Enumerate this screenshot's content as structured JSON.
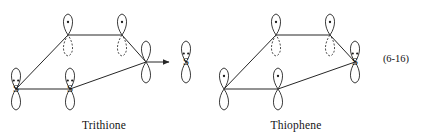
{
  "figure": {
    "equation_number": "(6-16)",
    "background_color": "#ffffff",
    "ink_color": "#262626",
    "structures": [
      {
        "id": "trithione",
        "caption": "Trithione",
        "caption_x": 104,
        "caption_y": 129,
        "atoms": [
          {
            "id": "c-top-left",
            "label": "",
            "x": 68,
            "y": 35,
            "orbital": "p-vertical-split",
            "electrons": 1,
            "lone_pair": false
          },
          {
            "id": "c-top-right",
            "label": "",
            "x": 122,
            "y": 35,
            "orbital": "p-vertical-split",
            "electrons": 1,
            "lone_pair": false
          },
          {
            "id": "c-right",
            "label": "",
            "x": 146,
            "y": 62,
            "orbital": "p-vertical-solid",
            "electrons": 0,
            "lone_pair": false
          },
          {
            "id": "s-bottom-left",
            "label": "S",
            "x": 16,
            "y": 89,
            "orbital": "p-vertical-solid",
            "electrons": 0,
            "lone_pair": true
          },
          {
            "id": "s-bottom-mid",
            "label": "S",
            "x": 70,
            "y": 89,
            "orbital": "p-vertical-solid",
            "electrons": 0,
            "lone_pair": true
          },
          {
            "id": "s-exocyclic",
            "label": "S",
            "x": 186,
            "y": 62,
            "orbital": "p-vertical-solid",
            "electrons": 0,
            "lone_pair": true
          }
        ],
        "bonds": [
          {
            "from": "c-top-left",
            "to": "c-top-right",
            "type": "line"
          },
          {
            "from": "c-top-right",
            "to": "c-right",
            "type": "line"
          },
          {
            "from": "c-top-left",
            "to": "s-bottom-left",
            "type": "line"
          },
          {
            "from": "s-bottom-left",
            "to": "s-bottom-mid",
            "type": "line"
          },
          {
            "from": "s-bottom-mid",
            "to": "c-right",
            "type": "line"
          },
          {
            "from": "c-right",
            "to": "s-exocyclic",
            "type": "arrow"
          }
        ]
      },
      {
        "id": "thiophene",
        "caption": "Thiophene",
        "caption_x": 296,
        "caption_y": 129,
        "atoms": [
          {
            "id": "c-top-left",
            "label": "",
            "x": 276,
            "y": 35,
            "orbital": "p-vertical-split",
            "electrons": 1,
            "lone_pair": false
          },
          {
            "id": "c-top-right",
            "label": "",
            "x": 330,
            "y": 35,
            "orbital": "p-vertical-split",
            "electrons": 1,
            "lone_pair": false
          },
          {
            "id": "s-right",
            "label": "S",
            "x": 355,
            "y": 62,
            "orbital": "p-vertical-solid",
            "electrons": 0,
            "lone_pair": true
          },
          {
            "id": "c-bottom-left",
            "label": "",
            "x": 224,
            "y": 89,
            "orbital": "p-vertical-solid",
            "electrons": 1,
            "lone_pair": false
          },
          {
            "id": "c-bottom-mid",
            "label": "",
            "x": 278,
            "y": 89,
            "orbital": "p-vertical-solid",
            "electrons": 1,
            "lone_pair": false
          }
        ],
        "bonds": [
          {
            "from": "c-top-left",
            "to": "c-top-right",
            "type": "line"
          },
          {
            "from": "c-top-right",
            "to": "s-right",
            "type": "line"
          },
          {
            "from": "c-top-left",
            "to": "c-bottom-left",
            "type": "line"
          },
          {
            "from": "c-bottom-left",
            "to": "c-bottom-mid",
            "type": "line"
          },
          {
            "from": "c-bottom-mid",
            "to": "s-right",
            "type": "line"
          }
        ]
      }
    ],
    "equation_number_x": 396,
    "equation_number_y": 62
  }
}
